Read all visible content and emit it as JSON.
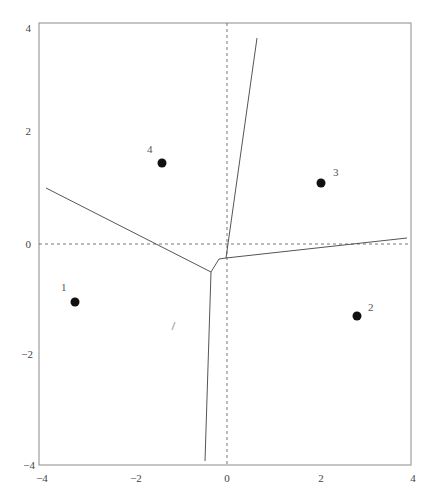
{
  "figure": {
    "type": "voronoi-diagram",
    "axes": {
      "xlim": [
        -4,
        4
      ],
      "ylim": [
        -4,
        4
      ],
      "x_ticks": [
        "−4",
        "−2",
        "0",
        "2",
        "4"
      ],
      "y_ticks": [
        "4",
        "2",
        "0",
        "−2",
        "−4"
      ],
      "dashed_reference_lines": [
        "x=0",
        "y=0"
      ]
    },
    "points": [
      {
        "label": "1",
        "x": -3.26,
        "y": -1.05
      },
      {
        "label": "2",
        "x": 2.81,
        "y": -1.3
      },
      {
        "label": "3",
        "x": 2.02,
        "y": 1.1
      },
      {
        "label": "4",
        "x": -1.4,
        "y": 1.46
      }
    ],
    "boundary_vertices": {
      "A": {
        "x": -0.35,
        "y": -0.51
      },
      "B": {
        "x": -0.17,
        "y": -0.27
      },
      "C": {
        "x": -0.02,
        "y": -0.25
      }
    },
    "edges": [
      {
        "from": [
          -3.9,
          1.0
        ],
        "to": "A"
      },
      {
        "from": "A",
        "to": [
          -0.47,
          -3.93
        ]
      },
      {
        "from": "A",
        "to": "B"
      },
      {
        "from": "B",
        "to": "C"
      },
      {
        "from": "C",
        "to": [
          0.65,
          3.73
        ]
      },
      {
        "from": "C",
        "to": [
          3.87,
          0.11
        ]
      }
    ],
    "colors": {
      "frame": "#888888",
      "edge": "#555555",
      "dashed": "#666666",
      "point": "#111111"
    }
  }
}
